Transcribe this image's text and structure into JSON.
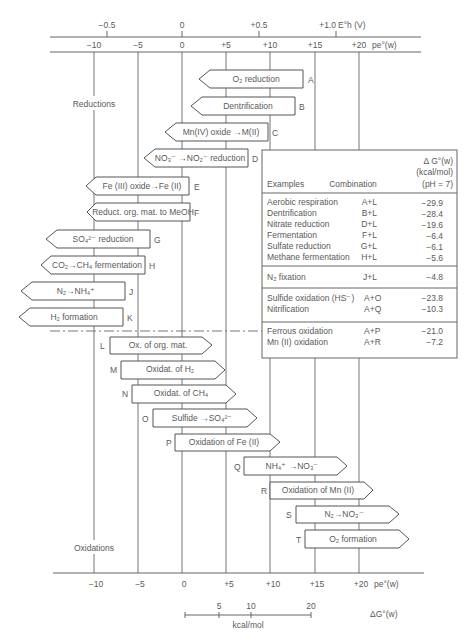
{
  "axes": {
    "eh": {
      "label": "E°h (V)",
      "ticks": [
        "−0.5",
        "0",
        "+0.5",
        "+1.0"
      ],
      "unit": "E°h (V)"
    },
    "pe_top": {
      "ticks": [
        "−10",
        "−5",
        "0",
        "+5",
        "+10",
        "+15",
        "+20"
      ],
      "unit": "pe°(w)"
    },
    "pe_bottom": {
      "ticks": [
        "−10",
        "−5",
        "0",
        "+5",
        "+10",
        "+15",
        "+20"
      ],
      "unit": "pe°(w)"
    },
    "dG_scale": {
      "ticks": [
        "5",
        "10",
        "20"
      ],
      "unit": "kcal/mol",
      "label": "ΔG°(w)"
    }
  },
  "section_labels": {
    "reductions": "Reductions",
    "oxidations": "Oxidations"
  },
  "reductions": [
    {
      "id": "A",
      "label": "O₂ reduction"
    },
    {
      "id": "B",
      "label": "Dentrification"
    },
    {
      "id": "C",
      "label": "Mn(IV) oxide →M(II)"
    },
    {
      "id": "D",
      "label": "NO₃⁻ →NO₂⁻ reduction"
    },
    {
      "id": "E",
      "label": "Fe (III) oxide→Fe (II)"
    },
    {
      "id": "F",
      "label": "Reduct. org. mat. to MeOH"
    },
    {
      "id": "G",
      "label": "SO₄²⁻ reduction"
    },
    {
      "id": "H",
      "label": "CO₂→CH₄ fermentation"
    },
    {
      "id": "J",
      "label": "N₂→NH₄⁺"
    },
    {
      "id": "K",
      "label": "H₂ formation"
    }
  ],
  "oxidations": [
    {
      "id": "L",
      "label": "Ox. of org. mat."
    },
    {
      "id": "M",
      "label": "Oxidat. of H₂"
    },
    {
      "id": "N",
      "label": "Oxidat. of CH₄"
    },
    {
      "id": "O",
      "label": "Sulfide →SO₄²⁻"
    },
    {
      "id": "P",
      "label": "Oxidation of Fe (II)"
    },
    {
      "id": "Q",
      "label": "NH₄⁺ →NO₃⁻"
    },
    {
      "id": "R",
      "label": "Oxidation of Mn (II)"
    },
    {
      "id": "S",
      "label": "N₂→NO₃⁻"
    },
    {
      "id": "T",
      "label": "O₂ formation"
    }
  ],
  "table": {
    "headers": {
      "examples": "Examples",
      "combination": "Combination",
      "dg1": "Δ G°(w)",
      "dg2": "(kcal/mol)",
      "dg3": "(pH = 7)"
    },
    "groups": [
      [
        {
          "example": "Aerobic respiration",
          "combination": "A+L",
          "dg": "−29.9"
        },
        {
          "example": "Dentrification",
          "combination": "B+L",
          "dg": "−28.4"
        },
        {
          "example": "Nitrate reduction",
          "combination": "D+L",
          "dg": "−19.6"
        },
        {
          "example": "Fermentation",
          "combination": "F+L",
          "dg": "−6.4"
        },
        {
          "example": "Sulfate reduction",
          "combination": "G+L",
          "dg": "−6.1"
        },
        {
          "example": "Methane fermentation",
          "combination": "H+L",
          "dg": "−5.6"
        }
      ],
      [
        {
          "example": "N₂ fixation",
          "combination": "J+L",
          "dg": "−4.8"
        }
      ],
      [
        {
          "example": "Sulfide oxidation (HS⁻)",
          "combination": "A+O",
          "dg": "−23.8"
        },
        {
          "example": "Nitrification",
          "combination": "A+Q",
          "dg": "−10.3"
        }
      ],
      [
        {
          "example": "Ferrous oxidation",
          "combination": "A+P",
          "dg": "−21.0"
        },
        {
          "example": "Mn (II) oxidation",
          "combination": "A+R",
          "dg": "−7.2"
        }
      ]
    ]
  }
}
